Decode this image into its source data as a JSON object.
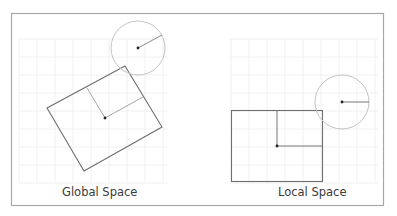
{
  "figure": {
    "panels": [
      {
        "id": "global",
        "label": "Global Space",
        "rectangle": {
          "rotated": true,
          "corners": [
            [
              125,
              66
            ],
            [
              162,
              127
            ],
            [
              84,
              171
            ],
            [
              47,
              108
            ]
          ],
          "center": [
            105,
            118
          ],
          "axis_endpoints": [
            [
              87,
              88
            ],
            [
              143,
              97
            ]
          ]
        },
        "circle": {
          "center": [
            138,
            48
          ],
          "radius": 27,
          "radius_end": [
            162,
            35
          ]
        }
      },
      {
        "id": "local",
        "label": "Local Space",
        "rectangle": {
          "rotated": false,
          "x": 231,
          "y": 110,
          "width": 91,
          "height": 71,
          "center": [
            277,
            146
          ],
          "axis_endpoints": [
            [
              277,
              110
            ],
            [
              322,
              146
            ]
          ]
        },
        "circle": {
          "center": [
            342,
            102
          ],
          "radius": 27,
          "radius_end": [
            369,
            102
          ]
        }
      }
    ],
    "colors": {
      "frame": "#a8a8a8",
      "grid": "#ececec",
      "shape_stroke": "#6e6e6e",
      "axis_stroke": "#a6a6a6",
      "circle_stroke": "#c4c4c4",
      "dot": "#222222",
      "label_text": "#3a3a3a"
    }
  }
}
